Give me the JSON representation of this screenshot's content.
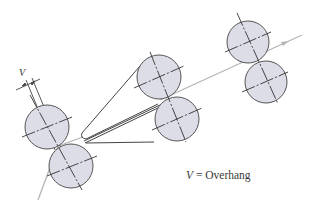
{
  "diagram": {
    "dimension_label": "V",
    "legend": {
      "symbol": "V",
      "equals": " = ",
      "text": "Overhang"
    },
    "colors": {
      "roller_fill": "#dcdde6",
      "roller_stroke": "#555555",
      "feed_line": "#b5b5b5",
      "line": "#444444"
    },
    "roller_pairs": [
      {
        "name": "left-pair",
        "upper": {
          "cx": 47,
          "cy": 127,
          "r": 22
        },
        "lower": {
          "cx": 71,
          "cy": 166,
          "r": 22
        }
      },
      {
        "name": "middle-pair",
        "upper": {
          "cx": 159,
          "cy": 77,
          "r": 22
        },
        "lower": {
          "cx": 177,
          "cy": 119,
          "r": 22
        }
      },
      {
        "name": "right-pair",
        "upper": {
          "cx": 248,
          "cy": 42,
          "r": 21
        },
        "lower": {
          "cx": 266,
          "cy": 82,
          "r": 21
        }
      }
    ]
  }
}
